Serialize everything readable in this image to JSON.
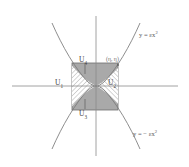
{
  "figure": {
    "background_color": "#ffffff",
    "axis_color": "#8c8c8c",
    "curve_color": "#7a7a7a",
    "square_fill": "#a9a9a9",
    "square_stroke": "#6e6e6e",
    "hatch_color": "#8a8a8a",
    "label_color": "#4a4a4a"
  },
  "axes": {
    "x_axis_label": "",
    "y_axis_label": "",
    "origin_x": 96,
    "origin_y": 86
  },
  "curves": [
    {
      "name": "upper-parabola",
      "label": "y = εx²",
      "label_base": "y = εx",
      "label_exponent": "2",
      "opens": "up"
    },
    {
      "name": "lower-parabola",
      "label": "y = − εx²",
      "label_base": "y = − εx",
      "label_exponent": "2",
      "opens": "down"
    }
  ],
  "regions": [
    {
      "id": "U1",
      "label_base": "U",
      "label_sub": "1",
      "position": "left",
      "shading": "hatched"
    },
    {
      "id": "U2",
      "label_base": "U",
      "label_sub": "2",
      "position": "right",
      "shading": "hatched"
    },
    {
      "id": "U3",
      "label_base": "U",
      "label_sub": "3",
      "position": "bottom",
      "shading": "solid-gray"
    },
    {
      "id": "U4",
      "label_base": "U",
      "label_sub": "4",
      "position": "top",
      "shading": "solid-gray"
    }
  ],
  "point": {
    "label": "(η, η)",
    "x_symbol": "η",
    "y_symbol": "η"
  }
}
